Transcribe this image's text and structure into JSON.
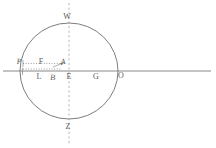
{
  "figure": {
    "kind": "geometry-diagram",
    "background_color": "#ffffff",
    "stroke_color": "#6e6e6e",
    "dashed_color": "#9a9a9a",
    "label_color": "#5a5a5a",
    "width": 216,
    "height": 148
  },
  "circle": {
    "center_x": 69,
    "center_y": 71,
    "radius_x": 49,
    "radius_y": 48
  },
  "axes": {
    "horizontal_line": {
      "x1": 3,
      "y1": 71,
      "x2": 211,
      "y2": 71
    },
    "vertical_dashed_line": {
      "x1": 69,
      "y1": 3,
      "x2": 69,
      "y2": 145
    }
  },
  "dotted_guides": [
    {
      "name": "upper-guide",
      "x1": 23,
      "y1": 63,
      "x2": 64,
      "y2": 63
    },
    {
      "name": "lower-guide",
      "x1": 23,
      "y1": 69,
      "x2": 62,
      "y2": 69
    }
  ],
  "arrow": {
    "x1": 52,
    "y1": 66,
    "x2": 64,
    "y2": 62
  },
  "labels": [
    {
      "id": "W",
      "text": "W",
      "x": 67,
      "y": 17
    },
    {
      "id": "P",
      "text": "P",
      "x": 19,
      "y": 62
    },
    {
      "id": "F",
      "text": "F",
      "x": 41,
      "y": 62
    },
    {
      "id": "A",
      "text": "A",
      "x": 63,
      "y": 62
    },
    {
      "id": "L",
      "text": "L",
      "x": 39,
      "y": 77
    },
    {
      "id": "B",
      "text": "B",
      "x": 53,
      "y": 78
    },
    {
      "id": "E",
      "text": "E",
      "x": 69,
      "y": 77
    },
    {
      "id": "G",
      "text": "G",
      "x": 96,
      "y": 77
    },
    {
      "id": "O",
      "text": "O",
      "x": 121,
      "y": 76
    },
    {
      "id": "Z",
      "text": "Z",
      "x": 68,
      "y": 127
    }
  ]
}
